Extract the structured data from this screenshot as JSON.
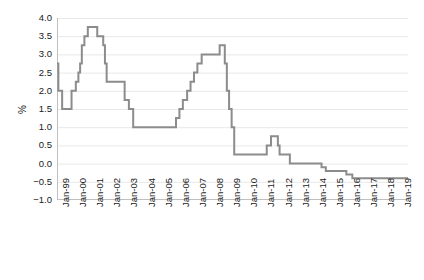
{
  "chart_data": {
    "type": "line",
    "title": "",
    "subtitle": "",
    "xlabel": "",
    "ylabel": "%",
    "ylim": [
      -1.0,
      4.0
    ],
    "ytick_labels": [
      "4.0",
      "3.5",
      "3.0",
      "2.5",
      "2.0",
      "1.5",
      "1.0",
      "0.5",
      "0.0",
      "-0.5",
      "-1.0"
    ],
    "ytick_values": [
      4.0,
      3.5,
      3.0,
      2.5,
      2.0,
      1.5,
      1.0,
      0.5,
      0.0,
      -0.5,
      -1.0
    ],
    "grid": true,
    "grid_axis": "y",
    "legend": "none",
    "line_style": "step-post",
    "line_color": "#8c8c8c",
    "grid_color": "#e8e8e8",
    "axis_color": "#bfbfbf",
    "xtick_labels": [
      "Jan-99",
      "Jan-00",
      "Jan-01",
      "Jan-02",
      "Jan-03",
      "Jan-04",
      "Jan-05",
      "Jan-06",
      "Jan-07",
      "Jan-08",
      "Jan-09",
      "Jan-10",
      "Jan-11",
      "Jan-12",
      "Jan-13",
      "Jan-14",
      "Jan-15",
      "Jan-16",
      "Jan-17",
      "Jan-18",
      "Jan-19"
    ],
    "xlim": [
      "Jan-99",
      "Jan-19"
    ],
    "x_start_year": 1999,
    "x_end_year": 2019.5,
    "series": [
      {
        "name": "Policy rate",
        "color": "#8c8c8c",
        "points": [
          {
            "x": 1999.0,
            "y": 2.75
          },
          {
            "x": 1999.08,
            "y": 2.0
          },
          {
            "x": 1999.3,
            "y": 1.5
          },
          {
            "x": 1999.85,
            "y": 2.0
          },
          {
            "x": 2000.1,
            "y": 2.25
          },
          {
            "x": 2000.25,
            "y": 2.5
          },
          {
            "x": 2000.35,
            "y": 2.75
          },
          {
            "x": 2000.45,
            "y": 3.25
          },
          {
            "x": 2000.6,
            "y": 3.5
          },
          {
            "x": 2000.8,
            "y": 3.75
          },
          {
            "x": 2001.35,
            "y": 3.5
          },
          {
            "x": 2001.7,
            "y": 3.25
          },
          {
            "x": 2001.8,
            "y": 2.75
          },
          {
            "x": 2001.9,
            "y": 2.25
          },
          {
            "x": 2002.95,
            "y": 1.75
          },
          {
            "x": 2003.2,
            "y": 1.5
          },
          {
            "x": 2003.45,
            "y": 1.0
          },
          {
            "x": 2005.95,
            "y": 1.25
          },
          {
            "x": 2006.15,
            "y": 1.5
          },
          {
            "x": 2006.35,
            "y": 1.75
          },
          {
            "x": 2006.6,
            "y": 2.0
          },
          {
            "x": 2006.8,
            "y": 2.25
          },
          {
            "x": 2007.0,
            "y": 2.5
          },
          {
            "x": 2007.2,
            "y": 2.75
          },
          {
            "x": 2007.45,
            "y": 3.0
          },
          {
            "x": 2008.5,
            "y": 3.25
          },
          {
            "x": 2008.8,
            "y": 2.75
          },
          {
            "x": 2008.92,
            "y": 2.0
          },
          {
            "x": 2009.05,
            "y": 1.5
          },
          {
            "x": 2009.2,
            "y": 1.0
          },
          {
            "x": 2009.35,
            "y": 0.25
          },
          {
            "x": 2011.25,
            "y": 0.5
          },
          {
            "x": 2011.5,
            "y": 0.75
          },
          {
            "x": 2011.9,
            "y": 0.5
          },
          {
            "x": 2012.0,
            "y": 0.25
          },
          {
            "x": 2012.6,
            "y": 0.0
          },
          {
            "x": 2014.45,
            "y": -0.1
          },
          {
            "x": 2014.7,
            "y": -0.2
          },
          {
            "x": 2015.9,
            "y": -0.3
          },
          {
            "x": 2016.25,
            "y": -0.4
          },
          {
            "x": 2019.5,
            "y": -0.4
          }
        ]
      }
    ]
  }
}
